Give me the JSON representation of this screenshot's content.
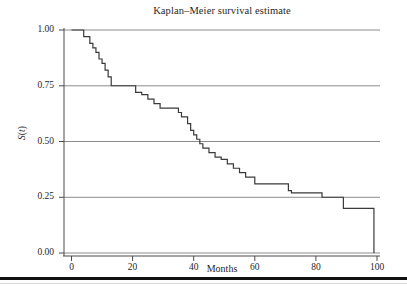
{
  "chart_data": {
    "type": "line",
    "subtype": "step-post",
    "title": "Kaplan–Meier survival estimate",
    "xlabel": "Months",
    "ylabel": "S(t)",
    "xlim": [
      0,
      100
    ],
    "ylim": [
      0.0,
      1.0
    ],
    "grid": true,
    "grid_axis": "y",
    "legend": null,
    "xticks": [
      0,
      20,
      40,
      60,
      80,
      100
    ],
    "xtick_labels": [
      "0",
      "20",
      "40",
      "60",
      "80",
      "100"
    ],
    "yticks": [
      0.0,
      0.25,
      0.5,
      0.75,
      1.0
    ],
    "ytick_labels": [
      "0.00",
      "0.25",
      "0.50",
      "0.75",
      "1.00"
    ],
    "series": [
      {
        "name": "survival",
        "color": "#3a3a3a",
        "x": [
          0,
          2,
          4,
          6,
          7,
          8,
          9,
          10,
          11,
          12,
          13,
          20,
          21,
          23,
          25,
          27,
          29,
          33,
          35,
          36,
          38,
          39,
          40,
          41,
          42,
          43,
          45,
          47,
          49,
          51,
          53,
          55,
          57,
          60,
          71,
          72,
          81,
          82,
          89,
          90,
          99
        ],
        "y": [
          1.0,
          1.0,
          0.97,
          0.94,
          0.92,
          0.9,
          0.87,
          0.85,
          0.82,
          0.79,
          0.75,
          0.75,
          0.72,
          0.71,
          0.69,
          0.67,
          0.65,
          0.65,
          0.63,
          0.61,
          0.58,
          0.55,
          0.53,
          0.51,
          0.49,
          0.47,
          0.45,
          0.43,
          0.42,
          0.4,
          0.38,
          0.36,
          0.34,
          0.31,
          0.28,
          0.27,
          0.27,
          0.25,
          0.2,
          0.2,
          0.13
        ],
        "final_drop_to": 0.0,
        "final_drop_x": 99
      }
    ]
  },
  "axes": {
    "y_tick_labels": [
      "1.00",
      "0.75",
      "0.50",
      "0.25",
      "0.00"
    ],
    "x_tick_labels": [
      "0",
      "20",
      "40",
      "60",
      "80",
      "100"
    ]
  },
  "style": {
    "curve_color": "#3a3a3a",
    "grid_color": "#8c8c8c",
    "axis_color": "#555555",
    "rule_color": "#111111"
  }
}
